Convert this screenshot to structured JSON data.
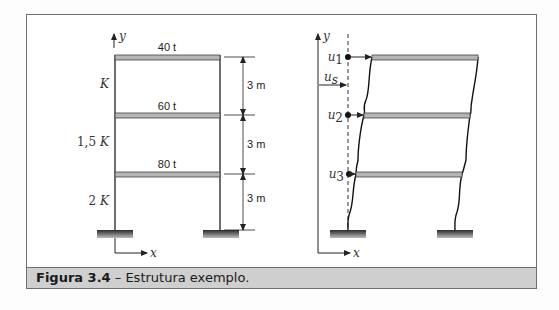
{
  "figure": {
    "caption_label": "Figura 3.4",
    "caption_sep": " – ",
    "caption_text": "Estrutura exemplo."
  },
  "left_diagram": {
    "axis_y": "y",
    "axis_x": "x",
    "floors": [
      {
        "mass": "40 t",
        "stiffness": "K",
        "height": "3 m"
      },
      {
        "mass": "60 t",
        "stiffness": "1,5 K",
        "height": "3 m"
      },
      {
        "mass": "80 t",
        "stiffness": "2 K",
        "height": "3 m"
      }
    ],
    "stiffness_symbol": "K",
    "stiffness_prefix": [
      "",
      "1,5",
      "2"
    ]
  },
  "right_diagram": {
    "axis_y": "y",
    "axis_x": "x",
    "displacements": [
      {
        "symbol": "u",
        "sub": "1"
      },
      {
        "symbol": "u",
        "sub": "s"
      },
      {
        "symbol": "u",
        "sub": "2"
      },
      {
        "symbol": "u",
        "sub": "3"
      }
    ]
  },
  "colors": {
    "beam_fill": "#b5b5b5",
    "line": "#222222",
    "caption_bg": "#cfcfcf",
    "border": "#6e6e6e"
  }
}
